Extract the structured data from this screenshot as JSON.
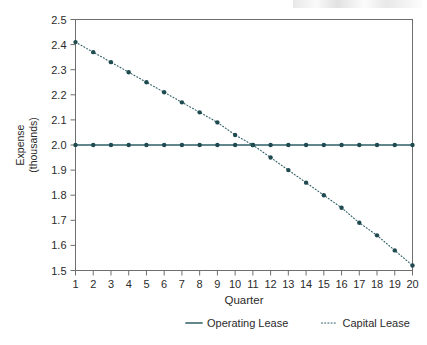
{
  "chart_data": {
    "type": "line",
    "title": "",
    "xlabel": "Quarter",
    "ylabel": "Expense\n(thousands)",
    "ylabel_line1": "Expense",
    "ylabel_line2": "(thousands)",
    "x": [
      1,
      2,
      3,
      4,
      5,
      6,
      7,
      8,
      9,
      10,
      11,
      12,
      13,
      14,
      15,
      16,
      17,
      18,
      19,
      20
    ],
    "categories": [
      "1",
      "2",
      "3",
      "4",
      "5",
      "6",
      "7",
      "8",
      "9",
      "10",
      "11",
      "12",
      "13",
      "14",
      "15",
      "16",
      "17",
      "18",
      "19",
      "20"
    ],
    "xtick_labels": [
      "1",
      "2",
      "3",
      "4",
      "5",
      "6",
      "7",
      "8",
      "9",
      "10",
      "11",
      "12",
      "13",
      "14",
      "15",
      "16",
      "17",
      "18",
      "19",
      "20"
    ],
    "ytick_labels": [
      "2.5",
      "2.4",
      "2.3",
      "2.2",
      "2.1",
      "2.0",
      "1.9",
      "1.8",
      "1.7",
      "1.6",
      "1.5"
    ],
    "ytick_values": [
      2.5,
      2.4,
      2.3,
      2.2,
      2.1,
      2.0,
      1.9,
      1.8,
      1.7,
      1.6,
      1.5
    ],
    "ylim": [
      1.5,
      2.5
    ],
    "xlim": [
      1,
      20
    ],
    "grid": false,
    "legend_position": "bottom",
    "series": [
      {
        "name": "Operating Lease",
        "style": "solid",
        "color": "#2e5f66",
        "marker": "circle",
        "values": [
          2.0,
          2.0,
          2.0,
          2.0,
          2.0,
          2.0,
          2.0,
          2.0,
          2.0,
          2.0,
          2.0,
          2.0,
          2.0,
          2.0,
          2.0,
          2.0,
          2.0,
          2.0,
          2.0,
          2.0
        ]
      },
      {
        "name": "Capital Lease",
        "style": "dotted",
        "color": "#2e5f66",
        "marker": "circle",
        "values": [
          2.41,
          2.37,
          2.33,
          2.29,
          2.25,
          2.21,
          2.17,
          2.13,
          2.09,
          2.04,
          2.0,
          1.95,
          1.9,
          1.85,
          1.8,
          1.75,
          1.69,
          1.64,
          1.58,
          1.52
        ]
      }
    ],
    "legend_entries": [
      {
        "label": "Operating Lease",
        "style": "solid",
        "color": "#2e5f66"
      },
      {
        "label": "Capital Lease",
        "style": "dotted",
        "color": "#2e5f66"
      }
    ],
    "axis_color": "#6e6e6e",
    "text_color": "#2b2b2b"
  }
}
